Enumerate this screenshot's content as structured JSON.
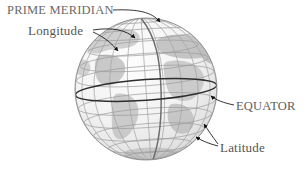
{
  "figure": {
    "kind": "globe-graticule-diagram",
    "background_color": "#ffffff"
  },
  "labels": {
    "prime_meridian": "PRIME MERIDIAN",
    "longitude": "Longitude",
    "equator": "EQUATOR",
    "latitude": "Latitude"
  },
  "colors": {
    "text": "#575757",
    "leader_line": "#1a1a1a",
    "graticule": "#9a9a9a",
    "graticule_light": "#b4b4b4",
    "prime_meridian_line": "#6f6f6f",
    "equator_line": "#2b2b2b",
    "sphere_outline": "#8c8c8c",
    "ocean_fill": "#f2f2f2",
    "land_fill": "#c4c4c4",
    "land_fill_dark": "#aeaeae"
  },
  "globe": {
    "center_x": 146,
    "center_y": 89,
    "radius": 71,
    "tilt_degrees": -4,
    "parallels_count": 9,
    "meridians_count": 12,
    "equator_emphasis": true,
    "prime_meridian_emphasis": true
  },
  "leaders": [
    {
      "name": "prime-meridian-leader",
      "from_label": "PRIME MERIDIAN",
      "points_to": "prime meridian line at top of globe"
    },
    {
      "name": "longitude-leader-upper",
      "from_label": "Longitude",
      "points_to": "meridian line upper right"
    },
    {
      "name": "longitude-leader-lower",
      "from_label": "Longitude",
      "points_to": "meridian line lower left"
    },
    {
      "name": "equator-leader",
      "from_label": "EQUATOR",
      "points_to": "equator line right side"
    },
    {
      "name": "latitude-leader-upper",
      "from_label": "Latitude",
      "points_to": "parallel line upper"
    },
    {
      "name": "latitude-leader-lower",
      "from_label": "Latitude",
      "points_to": "parallel line lower"
    }
  ]
}
